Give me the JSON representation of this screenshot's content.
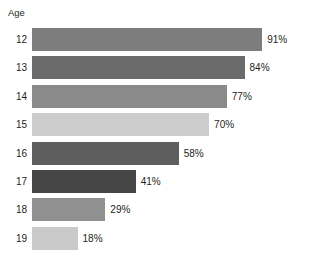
{
  "chart_data": {
    "type": "bar",
    "orientation": "horizontal",
    "title": "",
    "subtitle": "",
    "xlabel": "",
    "ylabel": "Age",
    "categories": [
      "12",
      "13",
      "14",
      "15",
      "16",
      "17",
      "18",
      "19"
    ],
    "values": [
      91,
      84,
      77,
      70,
      58,
      41,
      29,
      18
    ],
    "value_labels": [
      "91%",
      "84%",
      "77%",
      "70%",
      "58%",
      "41%",
      "29%",
      "18%"
    ],
    "xlim": [
      0,
      100
    ],
    "grid": false,
    "legend": null,
    "legend_position": "none",
    "units": "percent",
    "bar_colors": [
      "#7d7d7d",
      "#6b6b6b",
      "#8a8a8a",
      "#cdcdcd",
      "#5e5e5e",
      "#454545",
      "#909090",
      "#c9c9c9"
    ],
    "background_color": "#ffffff",
    "text_color": "#231f20",
    "series": [
      {
        "name": "",
        "values": [
          91,
          84,
          77,
          70,
          58,
          41,
          29,
          18
        ]
      }
    ],
    "points": [
      {
        "category": "12",
        "value": 91,
        "label": "91%",
        "color": "#7d7d7d"
      },
      {
        "category": "13",
        "value": 84,
        "label": "84%",
        "color": "#6b6b6b"
      },
      {
        "category": "14",
        "value": 77,
        "label": "77%",
        "color": "#8a8a8a"
      },
      {
        "category": "15",
        "value": 70,
        "label": "70%",
        "color": "#cdcdcd"
      },
      {
        "category": "16",
        "value": 58,
        "label": "58%",
        "color": "#5e5e5e"
      },
      {
        "category": "17",
        "value": 41,
        "label": "41%",
        "color": "#454545"
      },
      {
        "category": "18",
        "value": 29,
        "label": "29%",
        "color": "#909090"
      },
      {
        "category": "19",
        "value": 18,
        "label": "18%",
        "color": "#c9c9c9"
      }
    ]
  }
}
